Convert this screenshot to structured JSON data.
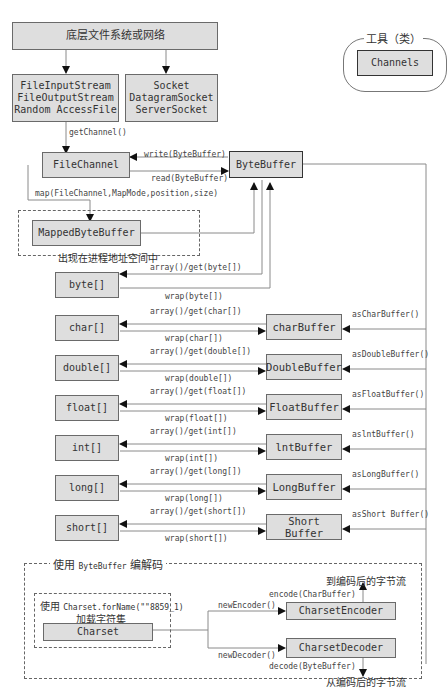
{
  "top": {
    "fs_network": "底层文件系统或网络",
    "streams": [
      "FileInputStream",
      "FileOutputStream",
      "Random AccessFile"
    ],
    "sockets": [
      "Socket",
      "DatagramSocket",
      "ServerSocket"
    ],
    "get_channel": "getChannel()"
  },
  "legend": {
    "title": "工具（类）",
    "channels": "Channels"
  },
  "channel": {
    "file_channel": "FileChannel",
    "byte_buffer": "ByteBuffer",
    "write": "write(ByteBuffer)",
    "read": "read(ByteBuffer)",
    "map": "map(FileChannel,MapMode,position,size)",
    "mapped_byte_buffer": "MappedByteBuffer",
    "mapped_note": "出现在进程地址空间中"
  },
  "byte_row": {
    "array": "byte[]",
    "get": "array()/get(byte[])",
    "wrap": "wrap(byte[])"
  },
  "rows": [
    {
      "array": "char[]",
      "get": "array()/get(char[])",
      "wrap": "wrap(char[])",
      "buffer": "charBuffer",
      "as": "asCharBuffer()"
    },
    {
      "array": "double[]",
      "get": "array()/get(double[])",
      "wrap": "wrap(double[])",
      "buffer": "DoubleBuffer",
      "as": "asDoubleBuffer()"
    },
    {
      "array": "float[]",
      "get": "array()/get(float[])",
      "wrap": "wrap(float[])",
      "buffer": "FloatBuffer",
      "as": "asFloatBuffer()"
    },
    {
      "array": "int[]",
      "get": "array()/get(int[])",
      "wrap": "wrap(int[])",
      "buffer": "lntBuffer",
      "as": "aslntBuffer()"
    },
    {
      "array": "long[]",
      "get": "array()/get(long[])",
      "wrap": "wrap(long[])",
      "buffer": "LongBuffer",
      "as": "asLongBuffer()"
    },
    {
      "array": "short[]",
      "get": "array()/get(short[])",
      "wrap": "wrap(short[])",
      "buffer": "Short Buffer",
      "as": "asShort Buffer()"
    }
  ],
  "codec": {
    "title_prefix": "使用",
    "title_code": "ByteBuffer",
    "title_suffix": "编解码",
    "charset_note_prefix": "使用",
    "charset_note_code": "Charset.forName(\"\"8859_1)",
    "charset_note_line2": "加载字符集",
    "charset": "Charset",
    "new_encoder": "newEncoder()",
    "new_decoder": "newDecoder()",
    "encoder": "CharsetEncoder",
    "decoder": "CharsetDecoder",
    "encode": "encode(CharBuffer)",
    "decode": "decode(ByteBuffer)",
    "to_stream": "到编码后的字节流",
    "from_stream": "从编码后的字节流"
  }
}
